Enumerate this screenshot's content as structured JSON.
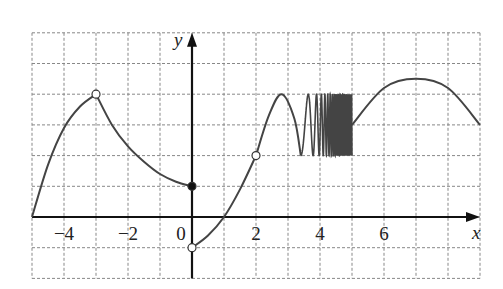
{
  "chart_data": {
    "type": "line",
    "title": "",
    "xlabel": "x",
    "ylabel": "y",
    "xlim": [
      -5,
      9
    ],
    "ylim": [
      -2,
      6
    ],
    "grid": true,
    "x_tick_labels": [
      "−4",
      "−2",
      "0",
      "2",
      "4",
      "6"
    ],
    "x_ticks": [
      -4,
      -2,
      0,
      2,
      4,
      6
    ],
    "segments": [
      {
        "name": "segment-1",
        "description": "concave-down rise",
        "points": [
          [
            -5,
            0
          ],
          [
            -4.5,
            1.7
          ],
          [
            -4,
            2.9
          ],
          [
            -3.5,
            3.6
          ],
          [
            -3,
            4
          ]
        ],
        "end": "open"
      },
      {
        "name": "segment-2",
        "description": "concave-up decrease",
        "points": [
          [
            -3,
            4
          ],
          [
            -2.5,
            3.0
          ],
          [
            -2,
            2.3
          ],
          [
            -1.5,
            1.8
          ],
          [
            -1,
            1.4
          ],
          [
            -0.5,
            1.15
          ],
          [
            0,
            1
          ]
        ],
        "end": "closed"
      },
      {
        "name": "segment-3",
        "description": "rise from open (0,-1) through (1,0) to open (2,2)",
        "points": [
          [
            0,
            -1
          ],
          [
            0.5,
            -0.6
          ],
          [
            1,
            0
          ],
          [
            1.5,
            0.9
          ],
          [
            2,
            2
          ]
        ],
        "start": "open",
        "end": "open"
      },
      {
        "name": "segment-4",
        "description": "rise to peak then rapid oscillation between 2 and 4 up to x=5",
        "points": [
          [
            2,
            2
          ],
          [
            2.4,
            3.3
          ],
          [
            2.8,
            4
          ],
          [
            3.2,
            3.2
          ],
          [
            3.4,
            2
          ]
        ],
        "oscillation": {
          "x_range": [
            3.4,
            5
          ],
          "y_min": 2,
          "y_max": 4,
          "frequency": "increasing"
        }
      },
      {
        "name": "segment-5",
        "description": "arch from (5,3) peaking near (7,4.5) down to (9,3)",
        "points": [
          [
            5,
            3
          ],
          [
            6,
            4.2
          ],
          [
            7,
            4.5
          ],
          [
            8,
            4.2
          ],
          [
            9,
            3
          ]
        ]
      }
    ],
    "marked_points": [
      {
        "x": -3,
        "y": 4,
        "style": "open"
      },
      {
        "x": 0,
        "y": 1,
        "style": "filled"
      },
      {
        "x": 0,
        "y": -1,
        "style": "open"
      },
      {
        "x": 2,
        "y": 2,
        "style": "open"
      }
    ]
  }
}
